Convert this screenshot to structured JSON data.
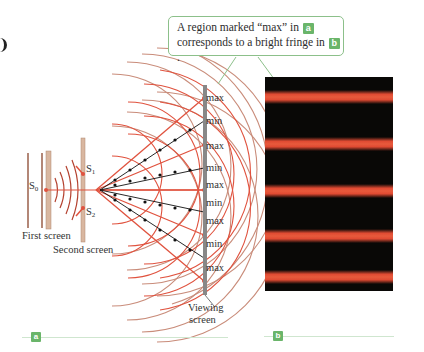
{
  "callout": {
    "line1_prefix": "A region marked “max” in",
    "tag_a": "a",
    "line2_prefix": "corresponds to a bright fringe in",
    "tag_b": "b",
    "line2_suffix": "."
  },
  "panel_a": {
    "tag": "a",
    "sources": {
      "s0": "S",
      "s0_sub": "0",
      "s1": "S",
      "s1_sub": "1",
      "s2": "S",
      "s2_sub": "2"
    },
    "labels": {
      "first_screen": "First screen",
      "second_screen": "Second screen",
      "viewing_screen_line1": "Viewing",
      "viewing_screen_line2": "screen"
    },
    "screen_markers": [
      "max",
      "min",
      "max",
      "min",
      "max",
      "min",
      "max",
      "min",
      "max"
    ],
    "colors": {
      "wave": "#e0523e",
      "wave_faded": "#c98c7a",
      "screen": "#888888",
      "node_line": "#111111"
    }
  },
  "panel_b": {
    "tag": "b",
    "bright_fringe_count": 5,
    "fringe_color": "#e04a32",
    "background_color": "#090806"
  }
}
